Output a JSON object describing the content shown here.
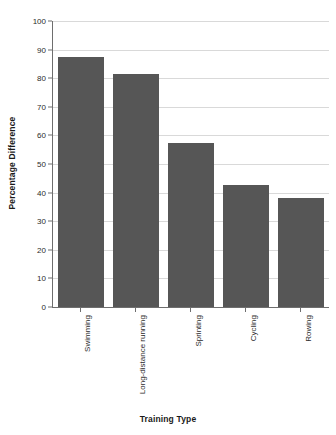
{
  "chart_data": {
    "type": "bar",
    "title": "",
    "xlabel": "Training Type",
    "ylabel": "Percentage Difference",
    "categories": [
      "Swimming",
      "Long-distance running",
      "Sprinting",
      "Cycling",
      "Rowing"
    ],
    "values": [
      87.5,
      81.5,
      57.5,
      42.5,
      38
    ],
    "ylim": [
      0,
      100
    ],
    "yticks": [
      0,
      10,
      20,
      30,
      40,
      50,
      60,
      70,
      80,
      90,
      100
    ],
    "ytick_labels": [
      "0",
      "10",
      "20",
      "30",
      "40",
      "50",
      "60",
      "70",
      "80",
      "90",
      "100"
    ],
    "grid": true,
    "legend": false,
    "bar_color": "#565656",
    "grid_color": "#d9d9d9",
    "axis_color": "#6e6e6e",
    "background_color": "#ffffff"
  }
}
